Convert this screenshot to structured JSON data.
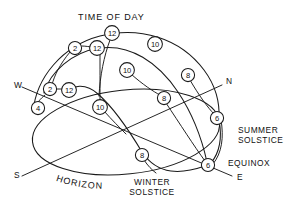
{
  "diagram": {
    "title": "TIME OF DAY",
    "type": "celestial-sphere-sun-path",
    "stroke_color": "#1a1a1a",
    "background_color": "#ffffff",
    "cardinals": [
      {
        "name": "west",
        "label": "W",
        "x": 14,
        "y": 88
      },
      {
        "name": "north",
        "label": "N",
        "x": 226,
        "y": 84
      },
      {
        "name": "south",
        "label": "S",
        "x": 14,
        "y": 178
      },
      {
        "name": "east",
        "label": "E",
        "x": 237,
        "y": 180
      }
    ],
    "annotations": [
      {
        "name": "summer-solstice",
        "lines": [
          "SUMMER",
          "SOLSTICE"
        ],
        "x": 238,
        "y": 133
      },
      {
        "name": "equinox",
        "lines": [
          "EQUINOX"
        ],
        "x": 228,
        "y": 166
      },
      {
        "name": "winter-solstice",
        "lines": [
          "WINTER",
          "SOLSTICE"
        ],
        "x": 152,
        "y": 185
      },
      {
        "name": "horizon",
        "lines": [
          "HORIZON"
        ],
        "x": 60,
        "y": 182
      }
    ],
    "hour_nodes": [
      {
        "id": "summer-12",
        "label": "12",
        "x": 112,
        "y": 33,
        "arc": "summer-solstice"
      },
      {
        "id": "summer-10",
        "label": "10",
        "x": 155,
        "y": 44,
        "arc": "summer-solstice"
      },
      {
        "id": "summer-8",
        "label": "8",
        "x": 188,
        "y": 75,
        "arc": "summer-solstice"
      },
      {
        "id": "summer-6",
        "label": "6",
        "x": 217,
        "y": 118,
        "arc": "summer-solstice"
      },
      {
        "id": "summer-2",
        "label": "2",
        "x": 75,
        "y": 48,
        "arc": "summer-solstice"
      },
      {
        "id": "summer-4",
        "label": "4",
        "x": 38,
        "y": 108,
        "arc": "summer-solstice"
      },
      {
        "id": "equinox-12",
        "label": "12",
        "x": 97,
        "y": 48,
        "arc": "equinox"
      },
      {
        "id": "equinox-10",
        "label": "10",
        "x": 127,
        "y": 70,
        "arc": "equinox"
      },
      {
        "id": "equinox-8",
        "label": "8",
        "x": 164,
        "y": 98,
        "arc": "equinox"
      },
      {
        "id": "equinox-6",
        "label": "6",
        "x": 208,
        "y": 165,
        "arc": "equinox"
      },
      {
        "id": "equinox-2",
        "label": "2",
        "x": 50,
        "y": 89,
        "arc": "equinox"
      },
      {
        "id": "winter-12",
        "label": "12",
        "x": 69,
        "y": 90,
        "arc": "winter-solstice"
      },
      {
        "id": "winter-10",
        "label": "10",
        "x": 100,
        "y": 107,
        "arc": "winter-solstice"
      },
      {
        "id": "winter-8",
        "label": "8",
        "x": 142,
        "y": 155,
        "arc": "winter-solstice"
      }
    ]
  }
}
